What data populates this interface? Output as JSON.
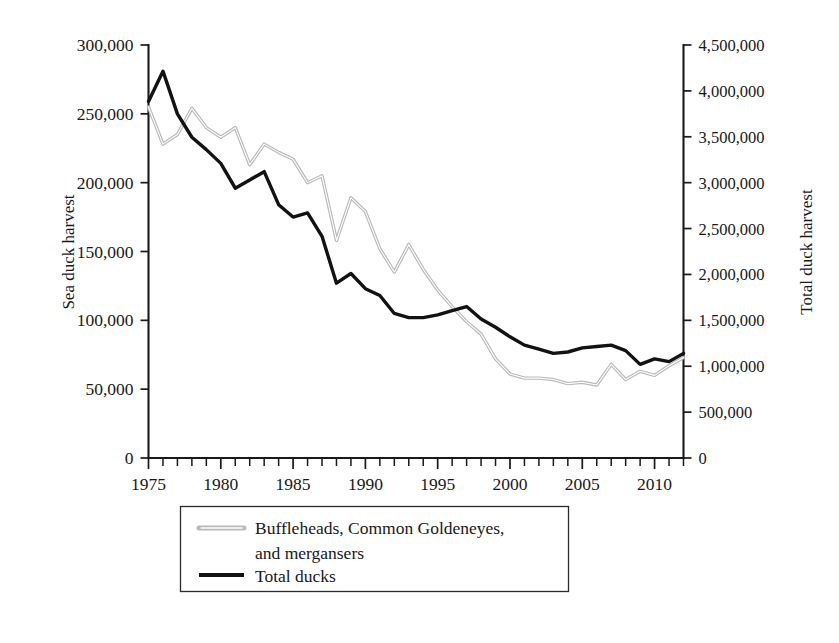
{
  "chart_data": {
    "type": "line",
    "title": "",
    "xlabel": "",
    "ylabel": "Sea duck harvest",
    "y2label": "Total duck harvest",
    "xlim": [
      1975,
      2012
    ],
    "ylim": [
      0,
      300000
    ],
    "y2lim": [
      0,
      4500000
    ],
    "grid": false,
    "legend_position": "below-center",
    "x_ticks_major": [
      "1975",
      "1980",
      "1985",
      "1990",
      "1995",
      "2000",
      "2005",
      "2010"
    ],
    "x_tick_values": [
      1975,
      1980,
      1985,
      1990,
      1995,
      2000,
      2005,
      2010
    ],
    "x_tick_interval_minor": 1,
    "y_ticks": [
      "0",
      "50,000",
      "100,000",
      "150,000",
      "200,000",
      "250,000",
      "300,000"
    ],
    "y_tick_values": [
      0,
      50000,
      100000,
      150000,
      200000,
      250000,
      300000
    ],
    "y2_ticks": [
      "0",
      "500,000",
      "1,000,000",
      "1,500,000",
      "2,000,000",
      "2,500,000",
      "3,000,000",
      "3,500,000",
      "4,000,000",
      "4,500,000"
    ],
    "y2_tick_values": [
      0,
      500000,
      1000000,
      1500000,
      2000000,
      2500000,
      3000000,
      3500000,
      4000000,
      4500000
    ],
    "x": [
      1975,
      1976,
      1977,
      1978,
      1979,
      1980,
      1981,
      1982,
      1983,
      1984,
      1985,
      1986,
      1987,
      1988,
      1989,
      1990,
      1991,
      1992,
      1993,
      1994,
      1995,
      1996,
      1997,
      1998,
      1999,
      2000,
      2001,
      2002,
      2003,
      2004,
      2005,
      2006,
      2007,
      2008,
      2009,
      2010,
      2011,
      2012
    ],
    "series": [
      {
        "name": "Buffleheads, Common Goldeneyes, and mergansers",
        "axis": "left",
        "color": "#b9b9b9",
        "style": "outlined-gray",
        "values": [
          255000,
          228000,
          235000,
          254000,
          240000,
          233000,
          240000,
          213000,
          228000,
          222000,
          217000,
          200000,
          205000,
          158000,
          189000,
          179000,
          152000,
          135000,
          155000,
          137000,
          122000,
          110000,
          99000,
          90000,
          72000,
          61000,
          58000,
          58000,
          57000,
          54000,
          55000,
          53000,
          68000,
          57000,
          63000,
          60000,
          67000,
          73000
        ]
      },
      {
        "name": "Total ducks",
        "axis": "right",
        "color": "#121212",
        "style": "solid-black",
        "values_left_scale": [
          259000,
          281000,
          250000,
          233000,
          224000,
          214000,
          196000,
          202000,
          208000,
          184000,
          175000,
          178000,
          161000,
          127000,
          134000,
          123000,
          118000,
          105000,
          102000,
          102000,
          104000,
          107000,
          110000,
          101000,
          95000,
          88000,
          82000,
          79000,
          76000,
          77000,
          80000,
          81000,
          82000,
          78000,
          68000,
          72000,
          70000,
          76000
        ],
        "values": [
          3885000,
          4215000,
          3750000,
          3495000,
          3360000,
          3210000,
          2940000,
          3030000,
          3120000,
          2760000,
          2625000,
          2670000,
          2415000,
          1905000,
          2010000,
          1845000,
          1770000,
          1575000,
          1530000,
          1530000,
          1560000,
          1605000,
          1650000,
          1515000,
          1425000,
          1320000,
          1230000,
          1185000,
          1140000,
          1155000,
          1200000,
          1215000,
          1230000,
          1170000,
          1020000,
          1080000,
          1050000,
          1140000
        ]
      }
    ]
  },
  "axes": {
    "left_title": "Sea duck harvest",
    "right_title": "Total duck harvest"
  },
  "legend": {
    "items": [
      {
        "label_line1": "Buffleheads, Common Goldeneyes,",
        "label_line2": "and mergansers",
        "swatch": "gray-outlined-line-swatch"
      },
      {
        "label_line1": "Total ducks",
        "label_line2": "",
        "swatch": "black-line-swatch"
      }
    ]
  }
}
